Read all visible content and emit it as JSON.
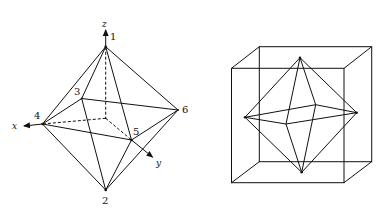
{
  "figure_left": {
    "title": "Octahedron with labeled vertices and axes",
    "vertices": [
      {
        "id": "1",
        "x": 105.7,
        "y": 46.7,
        "label_x": 110,
        "label_y": 40
      },
      {
        "id": "2",
        "x": 105.7,
        "y": 190,
        "label_x": 102,
        "label_y": 204
      },
      {
        "id": "3",
        "x": 81.7,
        "y": 98.5,
        "label_x": 74,
        "label_y": 95
      },
      {
        "id": "4",
        "x": 42.5,
        "y": 124,
        "label_x": 34,
        "label_y": 119
      },
      {
        "id": "5",
        "x": 131.5,
        "y": 140,
        "label_x": 133,
        "label_y": 135
      },
      {
        "id": "6",
        "x": 178,
        "y": 110,
        "label_x": 182,
        "label_y": 113
      }
    ],
    "axes": [
      {
        "name": "z",
        "label": "z",
        "label_x": 102,
        "label_y": 28
      },
      {
        "name": "x",
        "label": "x",
        "label_x": 12,
        "label_y": 129
      },
      {
        "name": "y",
        "label": "y",
        "label_x": 157,
        "label_y": 166
      }
    ],
    "center": {
      "x": 105.7,
      "y": 118.3
    }
  },
  "figure_right": {
    "title": "Octahedron inscribed in a cube",
    "cube_front": {
      "x1": 231.5,
      "y1": 68.3,
      "x2": 344,
      "y2": 182.7
    },
    "cube_back": {
      "x1": 259.3,
      "y1": 46.7,
      "x2": 371.7,
      "y2": 161.7
    },
    "octahedron": {
      "top": [
        300,
        57.7
      ],
      "bottom": [
        301.7,
        172.3
      ],
      "left": [
        245,
        117.3
      ],
      "right": [
        356.7,
        112.7
      ],
      "front": [
        286,
        124
      ],
      "back": [
        315.7,
        104.7
      ]
    }
  },
  "colors": {
    "stroke": "#111111",
    "background": "#ffffff"
  }
}
